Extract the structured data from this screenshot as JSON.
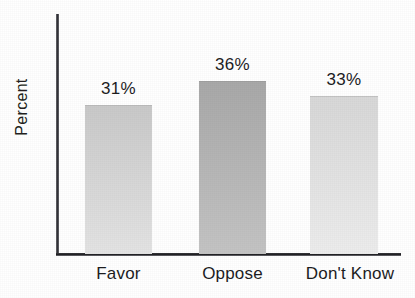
{
  "chart_data": {
    "type": "bar",
    "title": "",
    "xlabel": "",
    "ylabel": "Percent",
    "categories": [
      "Favor",
      "Oppose",
      "Don't Know"
    ],
    "values": [
      31,
      36,
      33
    ],
    "value_labels": [
      "31%",
      "36%",
      "33%"
    ],
    "unit": "%",
    "ylim": [
      0,
      50
    ],
    "grid": false,
    "legend": false,
    "axis_ticks": false,
    "bar_colors": [
      "#c9c9c9",
      "#a9a9a9",
      "#d8d8d8"
    ],
    "bar_color_bottoms": [
      "#e4e4e4",
      "#c4c4c4",
      "#ededed"
    ],
    "axis_color": "#232326",
    "text_color": "#1d1d1f",
    "background": "#ffffff"
  },
  "labels": {
    "y_axis": "Percent",
    "title_clipped": ""
  }
}
